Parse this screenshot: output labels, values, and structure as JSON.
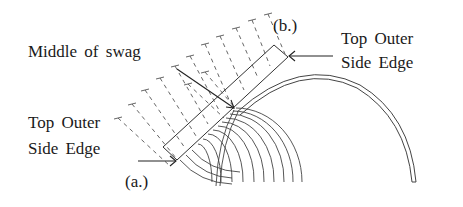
{
  "labels": {
    "middle": "Middle of swag",
    "b_marker": "(b.)",
    "a_marker": "(a.)",
    "right_edge_line1": "Top Outer",
    "right_edge_line2": "Side Edge",
    "left_edge_line1": "Top Outer",
    "left_edge_line2": "Side Edge"
  },
  "colors": {
    "ink": "#1a1a1a",
    "line": "#333333",
    "dash": "#555555"
  }
}
